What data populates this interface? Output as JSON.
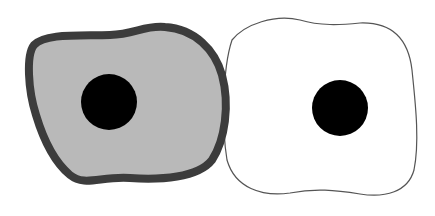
{
  "diagram": {
    "type": "cell-comparison",
    "cells": [
      {
        "id": "left-cell",
        "fill": "#b9b9b9",
        "border_color": "#3c3c3c",
        "border_style": "thick",
        "nucleus_color": "#000000"
      },
      {
        "id": "right-cell",
        "fill": "#ffffff",
        "border_color": "#555555",
        "border_style": "thin",
        "nucleus_color": "#000000"
      }
    ]
  }
}
